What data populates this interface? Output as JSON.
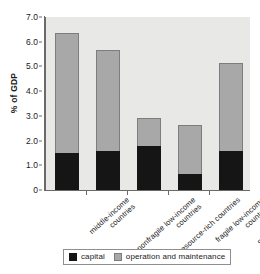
{
  "figure": {
    "title_remnant": "",
    "background_color": "#ffffff",
    "plot_background_color": "#e8e8e6"
  },
  "chart_data": {
    "type": "bar",
    "subtype": "stacked-vertical",
    "title": "",
    "xlabel": "",
    "ylabel": "% of GDP",
    "ylim": [
      0,
      7.0
    ],
    "ytick_values": [
      0,
      1.0,
      2.0,
      3.0,
      4.0,
      5.0,
      6.0,
      7.0
    ],
    "ytick_labels": [
      "0",
      "1.0",
      "2.0",
      "3.0",
      "4.0",
      "5.0",
      "6.0",
      "7.0"
    ],
    "grid": false,
    "legend_position": "bottom-center",
    "categories": [
      "middle-income countries",
      "nonfragile low-income countries",
      "resource-rich countries",
      "fragile low-income countries",
      "Sub-Saharan Africa"
    ],
    "category_lines": [
      [
        "middle-income",
        "countries"
      ],
      [
        "nonfragile low-income",
        "countries"
      ],
      [
        "resource-rich countries",
        ""
      ],
      [
        "fragile low-income",
        "countries"
      ],
      [
        "Sub-Saharan Africa",
        ""
      ]
    ],
    "series": [
      {
        "name": "capital",
        "color": "#151515",
        "values": [
          1.5,
          1.58,
          1.78,
          0.65,
          1.57
        ]
      },
      {
        "name": "operation and maintenance",
        "color": "#a8a8a8",
        "values": [
          4.85,
          4.09,
          1.12,
          1.98,
          3.57
        ]
      }
    ],
    "totals": [
      6.35,
      5.67,
      2.9,
      2.63,
      5.14
    ]
  },
  "legend": {
    "items": [
      {
        "label": "capital",
        "color": "#151515"
      },
      {
        "label": "operation and maintenance",
        "color": "#a8a8a8"
      }
    ]
  }
}
